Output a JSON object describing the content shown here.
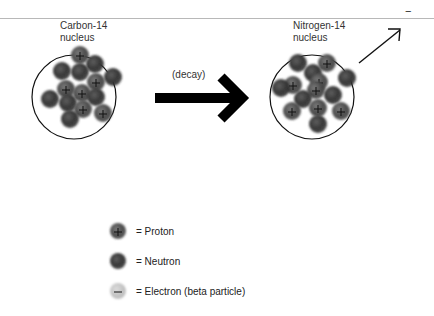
{
  "diagram": {
    "left_nucleus": {
      "label_line1": "Carbon-14",
      "label_line2": "nucleus",
      "center": [
        74,
        97
      ],
      "radius": 42,
      "particles": [
        {
          "x": 80,
          "y": 55,
          "type": "proton"
        },
        {
          "x": 95,
          "y": 64,
          "type": "neutron"
        },
        {
          "x": 62,
          "y": 71,
          "type": "neutron"
        },
        {
          "x": 80,
          "y": 72,
          "type": "neutron"
        },
        {
          "x": 113,
          "y": 77,
          "type": "neutron"
        },
        {
          "x": 96,
          "y": 82,
          "type": "proton"
        },
        {
          "x": 66,
          "y": 89,
          "type": "proton"
        },
        {
          "x": 82,
          "y": 93,
          "type": "proton"
        },
        {
          "x": 96,
          "y": 97,
          "type": "neutron"
        },
        {
          "x": 50,
          "y": 99,
          "type": "neutron"
        },
        {
          "x": 68,
          "y": 103,
          "type": "neutron"
        },
        {
          "x": 83,
          "y": 109,
          "type": "proton"
        },
        {
          "x": 103,
          "y": 113,
          "type": "proton"
        },
        {
          "x": 70,
          "y": 119,
          "type": "neutron"
        }
      ]
    },
    "right_nucleus": {
      "label_line1": "Nitrogen-14",
      "label_line2": "nucleus",
      "center": [
        312,
        97
      ],
      "radius": 42,
      "particles": [
        {
          "x": 298,
          "y": 63,
          "type": "neutron"
        },
        {
          "x": 327,
          "y": 63,
          "type": "proton"
        },
        {
          "x": 313,
          "y": 73,
          "type": "neutron"
        },
        {
          "x": 347,
          "y": 78,
          "type": "neutron"
        },
        {
          "x": 319,
          "y": 82,
          "type": "proton"
        },
        {
          "x": 293,
          "y": 85,
          "type": "proton"
        },
        {
          "x": 281,
          "y": 88,
          "type": "neutron"
        },
        {
          "x": 316,
          "y": 90,
          "type": "proton"
        },
        {
          "x": 333,
          "y": 95,
          "type": "neutron"
        },
        {
          "x": 303,
          "y": 99,
          "type": "neutron"
        },
        {
          "x": 318,
          "y": 108,
          "type": "proton"
        },
        {
          "x": 292,
          "y": 111,
          "type": "proton"
        },
        {
          "x": 341,
          "y": 111,
          "type": "proton"
        },
        {
          "x": 318,
          "y": 124,
          "type": "neutron"
        }
      ]
    },
    "decay_arrow": {
      "label": "(decay)"
    },
    "emitted_particle": {
      "symbol": "−"
    },
    "legend": [
      {
        "type": "proton",
        "text": "= Proton"
      },
      {
        "type": "neutron",
        "text": "= Neutron"
      },
      {
        "type": "electron",
        "text": "= Electron (beta particle)"
      }
    ],
    "colors": {
      "particle_dark": "#3a3a3a",
      "particle_mid": "#6a6a6a",
      "electron": "#c4c4c4",
      "outline": "#111111",
      "arrow": "#000000",
      "topline": "#b8b8b8"
    }
  }
}
